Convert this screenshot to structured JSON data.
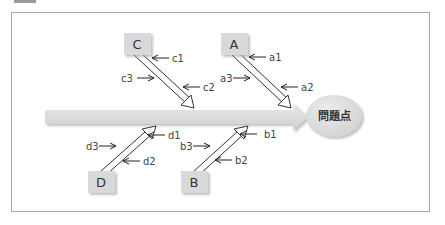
{
  "diagram": {
    "type": "fishbone",
    "problem": "問題点",
    "colors": {
      "spine": "#dcdcdc",
      "box": "#d9d9d9",
      "problem_bubble": "#e0e0e0",
      "frame": "#a8a8a8",
      "text": "#333333"
    },
    "categories": [
      {
        "id": "C",
        "label": "C",
        "position": "top",
        "factors": [
          "c1",
          "c2",
          "c3"
        ]
      },
      {
        "id": "A",
        "label": "A",
        "position": "top",
        "factors": [
          "a1",
          "a2",
          "a3"
        ]
      },
      {
        "id": "D",
        "label": "D",
        "position": "bottom",
        "factors": [
          "d1",
          "d2",
          "d3"
        ]
      },
      {
        "id": "B",
        "label": "B",
        "position": "bottom",
        "factors": [
          "b1",
          "b2",
          "b3"
        ]
      }
    ]
  },
  "labels": {
    "C": "C",
    "A": "A",
    "D": "D",
    "B": "B",
    "c1": "c1",
    "c2": "c2",
    "c3": "c3",
    "a1": "a1",
    "a2": "a2",
    "a3": "a3",
    "d1": "d1",
    "d2": "d2",
    "d3": "d3",
    "b1": "b1",
    "b2": "b2",
    "b3": "b3",
    "problem": "問題点"
  }
}
